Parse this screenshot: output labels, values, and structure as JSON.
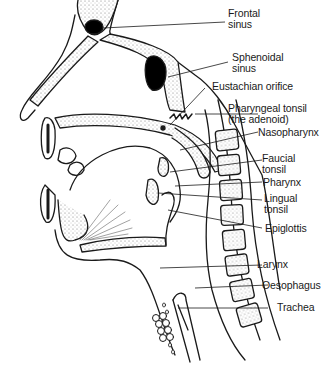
{
  "diagram": {
    "type": "anatomical cross-section",
    "colors": {
      "line": "#1a1a1a",
      "fill": "#ffffff",
      "stipple": "#d9d9d9",
      "cavity": "#000000"
    }
  },
  "labels": [
    {
      "id": "frontal-sinus",
      "lines": [
        "Frontal",
        "sinus"
      ]
    },
    {
      "id": "sphenoidal-sinus",
      "lines": [
        "Sphenoidal",
        "sinus"
      ]
    },
    {
      "id": "eustachian-orifice",
      "lines": [
        "Eustachian orifice"
      ]
    },
    {
      "id": "pharyngeal-tonsil",
      "lines": [
        "Pharyngeal tonsil",
        "(the adenoid)"
      ]
    },
    {
      "id": "nasopharynx",
      "lines": [
        "Nasopharynx"
      ]
    },
    {
      "id": "faucial-tonsil",
      "lines": [
        "Faucial",
        "tonsil"
      ]
    },
    {
      "id": "pharynx",
      "lines": [
        "Pharynx"
      ]
    },
    {
      "id": "lingual-tonsil",
      "lines": [
        "Lingual",
        "tonsil"
      ]
    },
    {
      "id": "epiglottis",
      "lines": [
        "Epiglottis"
      ]
    },
    {
      "id": "larynx",
      "lines": [
        "Larynx"
      ]
    },
    {
      "id": "oesophagus",
      "lines": [
        "Oesophagus"
      ]
    },
    {
      "id": "trachea",
      "lines": [
        "Trachea"
      ]
    }
  ]
}
